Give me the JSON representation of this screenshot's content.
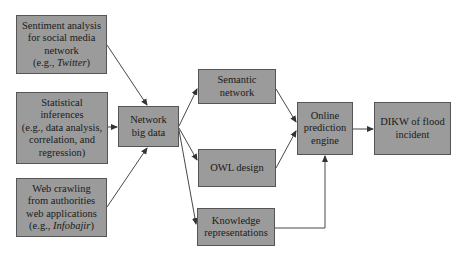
{
  "diagram": {
    "nodes": {
      "sentiment": {
        "lines": [
          "Sentiment analysis",
          "for social media",
          "network"
        ],
        "example_prefix": "(e.g., ",
        "example_italic": "Twitter",
        "example_suffix": ")"
      },
      "statistical": {
        "lines": [
          "Statistical",
          "inferences",
          "(e.g., data analysis,",
          "correlation, and",
          "regression)"
        ]
      },
      "webcrawl": {
        "lines": [
          "Web crawling",
          "from authorities",
          "web applications"
        ],
        "example_prefix": "(e.g., ",
        "example_italic": "Infobajir",
        "example_suffix": ")"
      },
      "network_big_data": {
        "lines": [
          "Network",
          "big data"
        ]
      },
      "semantic_network": {
        "lines": [
          "Semantic",
          "network"
        ]
      },
      "owl_design": {
        "lines": [
          "OWL design"
        ]
      },
      "knowledge_repr": {
        "lines": [
          "Knowledge",
          "representations"
        ]
      },
      "online_engine": {
        "lines": [
          "Online",
          "prediction",
          "engine"
        ]
      },
      "dikw": {
        "lines": [
          "DIKW of flood",
          "incident"
        ]
      }
    },
    "edges": [
      {
        "from": "sentiment",
        "to": "network_big_data"
      },
      {
        "from": "statistical",
        "to": "network_big_data"
      },
      {
        "from": "webcrawl",
        "to": "network_big_data"
      },
      {
        "from": "network_big_data",
        "to": "semantic_network"
      },
      {
        "from": "network_big_data",
        "to": "owl_design"
      },
      {
        "from": "network_big_data",
        "to": "knowledge_repr"
      },
      {
        "from": "semantic_network",
        "to": "online_engine"
      },
      {
        "from": "owl_design",
        "to": "online_engine"
      },
      {
        "from": "knowledge_repr",
        "to": "online_engine"
      },
      {
        "from": "online_engine",
        "to": "dikw"
      }
    ],
    "colors": {
      "box_fill": "#9b9b9b",
      "box_border": "#555555",
      "edge": "#333333"
    }
  }
}
